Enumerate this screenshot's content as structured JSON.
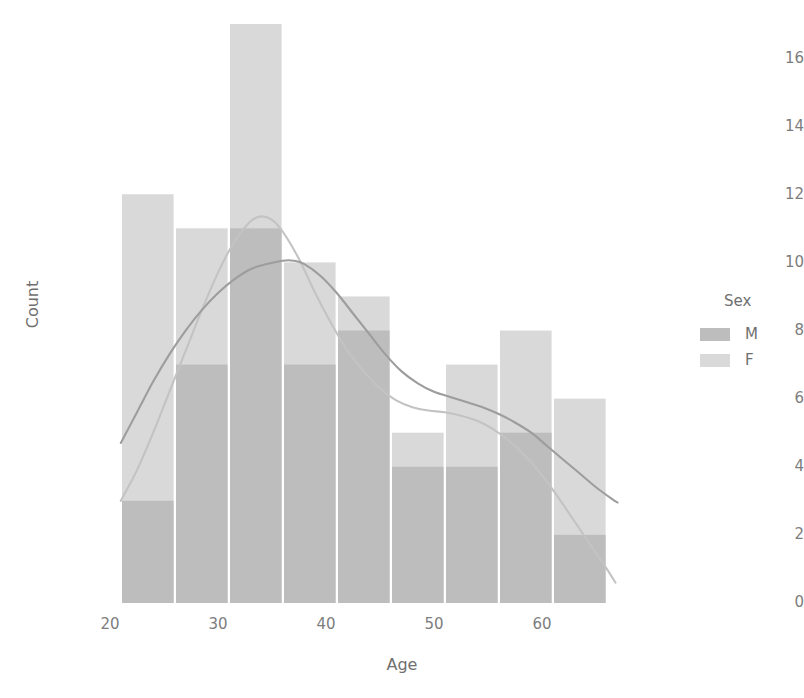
{
  "chart_data": {
    "type": "bar",
    "title": "",
    "xlabel": "Age",
    "ylabel": "Count",
    "xlim": [
      19.5,
      67.5
    ],
    "ylim": [
      0,
      17.5
    ],
    "xticks": [
      20,
      30,
      40,
      50,
      60
    ],
    "yticks": [
      0,
      2,
      4,
      6,
      8,
      10,
      12,
      14,
      16
    ],
    "grid": false,
    "legend_position": "right",
    "legend_title": "Sex",
    "bin_edges": [
      21,
      26,
      31,
      36,
      41,
      46,
      51,
      56,
      61,
      66
    ],
    "bin_centers": [
      23.5,
      28.5,
      33.5,
      38.5,
      43.5,
      48.5,
      53.5,
      58.5,
      63.5
    ],
    "series": [
      {
        "name": "F",
        "color": "#d9d9d9",
        "values": [
          12,
          11,
          17,
          10,
          9,
          5,
          7,
          8,
          6
        ]
      },
      {
        "name": "M",
        "color": "#bdbdbd",
        "values": [
          3,
          7,
          11,
          7,
          8,
          4,
          4,
          5,
          2
        ]
      }
    ],
    "density_curves": [
      {
        "name": "F",
        "color": "#c3c3c3",
        "points": [
          [
            21.0,
            3.0
          ],
          [
            22.5,
            3.9
          ],
          [
            24.0,
            5.0
          ],
          [
            25.5,
            6.2
          ],
          [
            27.0,
            7.4
          ],
          [
            28.5,
            8.6
          ],
          [
            30.0,
            9.7
          ],
          [
            31.5,
            10.6
          ],
          [
            33.0,
            11.2
          ],
          [
            34.0,
            11.35
          ],
          [
            35.0,
            11.25
          ],
          [
            36.0,
            10.9
          ],
          [
            37.5,
            10.1
          ],
          [
            39.0,
            9.1
          ],
          [
            40.5,
            8.2
          ],
          [
            42.0,
            7.4
          ],
          [
            43.5,
            6.8
          ],
          [
            45.0,
            6.3
          ],
          [
            46.5,
            5.95
          ],
          [
            48.0,
            5.75
          ],
          [
            49.5,
            5.65
          ],
          [
            51.0,
            5.6
          ],
          [
            52.5,
            5.5
          ],
          [
            54.0,
            5.35
          ],
          [
            55.5,
            5.1
          ],
          [
            57.0,
            4.75
          ],
          [
            58.5,
            4.3
          ],
          [
            60.0,
            3.75
          ],
          [
            61.5,
            3.1
          ],
          [
            63.0,
            2.4
          ],
          [
            64.5,
            1.7
          ],
          [
            66.0,
            1.0
          ],
          [
            66.8,
            0.6
          ]
        ]
      },
      {
        "name": "M",
        "color": "#9d9d9d",
        "points": [
          [
            21.0,
            4.7
          ],
          [
            22.5,
            5.6
          ],
          [
            24.0,
            6.5
          ],
          [
            25.5,
            7.3
          ],
          [
            27.0,
            8.0
          ],
          [
            28.5,
            8.6
          ],
          [
            30.0,
            9.1
          ],
          [
            31.5,
            9.5
          ],
          [
            33.0,
            9.8
          ],
          [
            34.5,
            9.95
          ],
          [
            36.0,
            10.05
          ],
          [
            37.0,
            10.05
          ],
          [
            38.0,
            9.95
          ],
          [
            39.5,
            9.6
          ],
          [
            41.0,
            9.1
          ],
          [
            42.5,
            8.5
          ],
          [
            44.0,
            7.9
          ],
          [
            45.5,
            7.3
          ],
          [
            47.0,
            6.8
          ],
          [
            48.5,
            6.45
          ],
          [
            50.0,
            6.2
          ],
          [
            51.5,
            6.05
          ],
          [
            53.0,
            5.9
          ],
          [
            54.5,
            5.75
          ],
          [
            56.0,
            5.55
          ],
          [
            57.5,
            5.3
          ],
          [
            59.0,
            5.0
          ],
          [
            60.5,
            4.6
          ],
          [
            62.0,
            4.2
          ],
          [
            63.5,
            3.8
          ],
          [
            65.0,
            3.4
          ],
          [
            66.5,
            3.05
          ],
          [
            67.0,
            2.95
          ]
        ]
      }
    ]
  },
  "axis": {
    "y_tick_labels": [
      "16",
      "14",
      "12",
      "10",
      "8",
      "6",
      "4",
      "2",
      "0"
    ],
    "x_tick_labels": [
      "20",
      "30",
      "40",
      "50",
      "60"
    ],
    "y_title": "Count",
    "x_title": "Age"
  },
  "legend": {
    "title": "Sex",
    "items": [
      {
        "label": "M",
        "color": "#bdbdbd"
      },
      {
        "label": "F",
        "color": "#d9d9d9"
      }
    ]
  }
}
